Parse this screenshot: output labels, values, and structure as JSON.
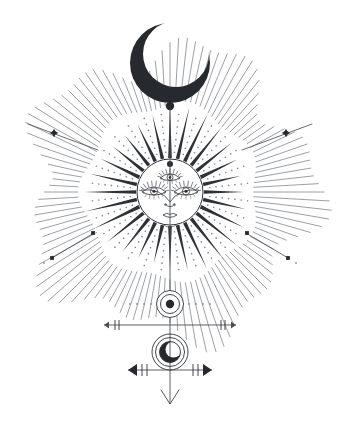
{
  "artwork": {
    "title": "Celestial Sun and Moon Mystical Emblem",
    "style": "line-art-engraving",
    "canvas": {
      "width": 340,
      "height": 432,
      "background": "#ffffff"
    },
    "colors": {
      "ink": "#2e3238",
      "ink_soft": "#4a5058",
      "ink_faint": "#8a9099",
      "fill_dark": "#26292e",
      "background": "#ffffff"
    },
    "elements": {
      "crescent_moon_top": {
        "name": "crescent-moon-top",
        "center_x": 170,
        "center_y": 63,
        "outer_radius": 40,
        "inner_radius": 33,
        "inner_offset_x": 6,
        "inner_offset_y": -9,
        "fill": "#26292e"
      },
      "moon_stem_dot": {
        "name": "moon-stem-dot",
        "cx": 170,
        "cy": 106,
        "r": 4.2,
        "fill": "#26292e"
      },
      "sun_disc": {
        "name": "sun-disc",
        "cx": 170,
        "cy": 192,
        "r": 33,
        "stroke": "#2e3238",
        "fill": "#ffffff"
      },
      "forehead_dot": {
        "name": "forehead-dot",
        "cx": 170,
        "cy": 164,
        "r": 3.0,
        "fill": "#26292e"
      },
      "third_eye": {
        "name": "third-eye",
        "cx": 170,
        "cy": 178,
        "half_width": 10,
        "lash_count": 9
      },
      "left_eye": {
        "name": "left-eye",
        "cx": 154,
        "cy": 192,
        "half_width": 12,
        "lash_count": 10
      },
      "right_eye": {
        "name": "right-eye",
        "cx": 186,
        "cy": 192,
        "half_width": 12,
        "lash_count": 10
      },
      "nose": {
        "name": "nose",
        "cx": 170,
        "cy": 204
      },
      "mouth": {
        "name": "mouth",
        "cx": 170,
        "cy": 215
      },
      "chin": {
        "name": "chin",
        "cx": 170,
        "cy": 224
      },
      "inner_spike_rays": {
        "name": "inner-spike-rays",
        "count": 28,
        "inner_radius": 34,
        "outer_radius": 80,
        "half_angle_deg": 3.1,
        "fill": "#2e3238"
      },
      "dotted_rays": {
        "name": "dotted-rays",
        "count": 28,
        "inner_radius": 40,
        "outer_radius": 78,
        "dot_count": 7,
        "dot_radius": 0.85,
        "fill": "#8a9099"
      },
      "outer_line_rays": {
        "name": "outer-line-rays",
        "count": 112,
        "inner_radius": 88,
        "outer_radius": 140,
        "stroke": "#4a5058",
        "stroke_width": 0.55
      },
      "accent_line_upper_left": {
        "name": "accent-line-upper-left",
        "x1": 28,
        "y1": 124,
        "x2": 98,
        "y2": 150,
        "star_x": 54,
        "star_y": 133
      },
      "accent_line_upper_right": {
        "name": "accent-line-upper-right",
        "x1": 312,
        "y1": 124,
        "x2": 242,
        "y2": 150,
        "star_x": 286,
        "star_y": 133
      },
      "accent_line_lower_left": {
        "name": "accent-line-lower-left",
        "x1": 52,
        "y1": 258,
        "x2": 94,
        "y2": 233,
        "dot_a_x": 52,
        "dot_a_y": 258,
        "dot_b_x": 93,
        "dot_b_y": 233,
        "speck_x": 44,
        "speck_y": 263
      },
      "accent_line_lower_right": {
        "name": "accent-line-lower-right",
        "x1": 288,
        "y1": 258,
        "x2": 246,
        "y2": 233,
        "dot_a_x": 288,
        "dot_a_y": 258,
        "dot_b_x": 247,
        "dot_b_y": 233,
        "speck_x": 296,
        "speck_y": 263
      },
      "orb_upper": {
        "name": "orb-upper-double-circle",
        "cx": 170,
        "cy": 304,
        "outer_r": 13.5,
        "inner_r": 9.5,
        "dot_r": 4.2
      },
      "orb_upper_side_dots": {
        "name": "orb-upper-side-dots",
        "count_per_side": 4,
        "start_offset": 19,
        "spacing": 7,
        "dot_radius": 0.9
      },
      "arrow_bar_upper": {
        "name": "arrow-bar-upper",
        "y": 325,
        "x_left": 104,
        "x_right": 236,
        "arrow_size": 5,
        "tick_offsets": [
          11,
          15
        ],
        "tick_half_height": 5
      },
      "orb_lower": {
        "name": "orb-lower-moon-in-circles",
        "cx": 170,
        "cy": 352,
        "arc_outer_r": 18,
        "arc_mid_r": 14.5,
        "disc_r": 10.5,
        "crescent_offset_x": 3.5,
        "crescent_offset_y": -2.5,
        "crescent_r": 8.0
      },
      "arrow_bar_lower": {
        "name": "arrow-bar-lower",
        "y": 370,
        "x_left": 128,
        "x_right": 212,
        "arrow_size": 9,
        "tick_offsets": [
          14,
          19
        ],
        "tick_half_height": 6
      },
      "axis_line": {
        "name": "vertical-axis-line",
        "x": 170,
        "y_top": 110,
        "y_bottom": 404
      },
      "bottom_chevron": {
        "name": "bottom-chevron-arrow",
        "cx": 170,
        "tip_y": 404,
        "half_width": 9,
        "height": 14
      }
    },
    "labels": {
      "moon": "crescent moon",
      "sun": "radiant sun face",
      "third_eye": "third eye",
      "orb": "celestial orb",
      "arrow": "directional axis"
    }
  }
}
